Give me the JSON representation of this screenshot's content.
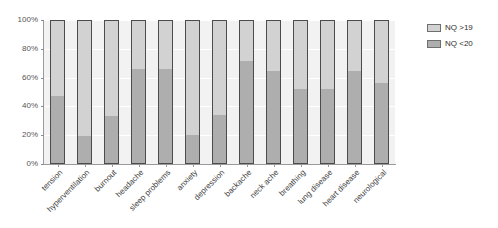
{
  "chart_data": {
    "type": "bar",
    "subtype": "stacked-100-percent",
    "title": "",
    "xlabel": "",
    "ylabel": "",
    "ylim": [
      0,
      100
    ],
    "ytick_labels": [
      "0%",
      "20%",
      "40%",
      "60%",
      "80%",
      "100%"
    ],
    "ytick_values": [
      0,
      20,
      40,
      60,
      80,
      100
    ],
    "grid": true,
    "grid_axis": "y",
    "legend_position": "right",
    "categories": [
      "tension",
      "hyperventilation",
      "burnout",
      "headache",
      "sleep problems",
      "anxiety",
      "depression",
      "backache",
      "neck ache",
      "breathing",
      "lung disease",
      "heart disease",
      "neurological"
    ],
    "series": [
      {
        "name": "NQ <20",
        "color": "#aeaeae",
        "values": [
          47,
          19,
          33,
          66,
          66,
          20,
          34,
          72,
          65,
          52,
          52,
          65,
          56
        ]
      },
      {
        "name": "NQ >19",
        "color": "#d2d2d2",
        "values": [
          53,
          81,
          67,
          34,
          34,
          80,
          66,
          28,
          35,
          48,
          48,
          35,
          44
        ]
      }
    ]
  },
  "legend": {
    "items": [
      {
        "label": "NQ >19",
        "color": "#d2d2d2"
      },
      {
        "label": "NQ <20",
        "color": "#aeaeae"
      }
    ]
  },
  "colors": {
    "plot_background": "#f2f2f2",
    "page_background": "#ffffff",
    "bar_outline": "#4c4c4c",
    "axis": "#9a9a9a",
    "tick_text": "#555555",
    "category_text": "#3d3d3d",
    "gridline": "#ffffff"
  }
}
